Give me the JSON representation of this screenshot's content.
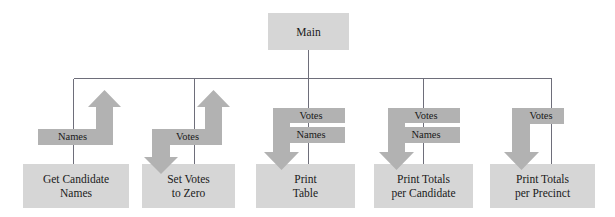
{
  "diagram": {
    "type": "structure-chart",
    "palette": {
      "box_fill": "#d6d6d6",
      "arrow_fill": "#b2b2b2",
      "line": "#6e6e7a",
      "text": "#1a1a1a",
      "background": "#ffffff"
    },
    "root": {
      "id": "main",
      "label": "Main",
      "x": 268,
      "y": 13,
      "w": 81,
      "h": 37
    },
    "modules": [
      {
        "id": "get-candidate-names",
        "line1": "Get Candidate",
        "line2": "Names",
        "x": 23,
        "y": 164,
        "w": 106,
        "h": 44,
        "connector_x": 73
      },
      {
        "id": "set-votes-to-zero",
        "line1": "Set Votes",
        "line2": "to Zero",
        "x": 142,
        "y": 164,
        "w": 93,
        "h": 44,
        "connector_x": 194
      },
      {
        "id": "print-table",
        "line1": "Print",
        "line2": "Table",
        "x": 256,
        "y": 164,
        "w": 99,
        "h": 44,
        "connector_x": 308
      },
      {
        "id": "print-totals-per-candidate",
        "line1": "Print Totals",
        "line2": "per Candidate",
        "x": 374,
        "y": 164,
        "w": 99,
        "h": 44,
        "connector_x": 423
      },
      {
        "id": "print-totals-per-precinct",
        "line1": "Print Totals",
        "line2": "per Precinct",
        "x": 490,
        "y": 164,
        "w": 105,
        "h": 44,
        "connector_x": 551
      }
    ],
    "data_flows": [
      {
        "id": "flow-names-up",
        "label": "Names",
        "direction": "up",
        "module": "get-candidate-names",
        "label_x": 38,
        "label_y": 131,
        "label_w": 69
      },
      {
        "id": "flow-votes-down-2",
        "label": "",
        "direction": "down",
        "module": "set-votes-to-zero"
      },
      {
        "id": "flow-votes-up-2",
        "label": "Votes",
        "direction": "up",
        "module": "set-votes-to-zero",
        "label_x": 153,
        "label_y": 131,
        "label_w": 69
      },
      {
        "id": "flow-votes-down-3",
        "label": "Votes",
        "direction": "down",
        "module": "print-table",
        "label_x": 277,
        "label_y": 110,
        "label_w": 68
      },
      {
        "id": "flow-names-down-3",
        "label": "Names",
        "direction": "down",
        "module": "print-table",
        "label_x": 277,
        "label_y": 129,
        "label_w": 68
      },
      {
        "id": "flow-votes-down-4",
        "label": "Votes",
        "direction": "down",
        "module": "print-totals-per-candidate",
        "label_x": 392,
        "label_y": 110,
        "label_w": 68
      },
      {
        "id": "flow-names-down-4",
        "label": "Names",
        "direction": "down",
        "module": "print-totals-per-candidate",
        "label_x": 392,
        "label_y": 129,
        "label_w": 68
      },
      {
        "id": "flow-votes-down-5",
        "label": "Votes",
        "direction": "down",
        "module": "print-totals-per-precinct",
        "label_x": 518,
        "label_y": 110,
        "label_w": 46
      }
    ],
    "bus": {
      "y": 78,
      "x_start": 73,
      "x_end": 551,
      "stem_x": 308,
      "stem_top": 50
    }
  }
}
